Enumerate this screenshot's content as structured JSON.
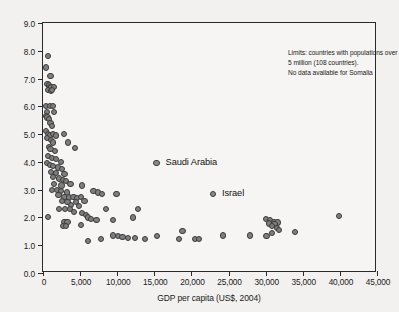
{
  "chart_data": {
    "type": "scatter",
    "title": "",
    "xlabel": "GDP per capita (US$, 2004)",
    "ylabel": "Total fertility rate (children per woman)",
    "xlim": [
      0,
      45000
    ],
    "ylim": [
      0.0,
      9.0
    ],
    "grid": false,
    "legend": "none",
    "xticks": [
      "0",
      "5,000",
      "10,000",
      "15,000",
      "20,000",
      "25,000",
      "30,000",
      "35,000",
      "40,000",
      "45,000"
    ],
    "xtick_values": [
      0,
      5000,
      10000,
      15000,
      20000,
      25000,
      30000,
      35000,
      40000,
      45000
    ],
    "yticks": [
      "0.0",
      "1.0",
      "2.0",
      "3.0",
      "4.0",
      "5.0",
      "6.0",
      "7.0",
      "8.0",
      "9.0"
    ],
    "ytick_values": [
      0,
      1,
      2,
      3,
      4,
      5,
      6,
      7,
      8,
      9
    ],
    "annotations": [
      {
        "name": "limits-note",
        "lines": [
          "Limits: countries with populations over",
          "5 million (108 countries).",
          "No data available for Somalia"
        ]
      }
    ],
    "point_labels": [
      {
        "name": "Saudi Arabia",
        "x": 15300,
        "y": 3.95
      },
      {
        "name": "Israel",
        "x": 22900,
        "y": 2.85
      }
    ],
    "marker": {
      "shape": "circle",
      "fill": "#7e7e7e",
      "edge": "#3b3b3b",
      "size_px": 6.2
    },
    "points": [
      [
        700,
        7.8
      ],
      [
        450,
        7.4
      ],
      [
        1000,
        7.1
      ],
      [
        600,
        6.8
      ],
      [
        800,
        6.75
      ],
      [
        950,
        6.7
      ],
      [
        1150,
        6.7
      ],
      [
        1500,
        6.7
      ],
      [
        700,
        6.6
      ],
      [
        1050,
        6.55
      ],
      [
        1250,
        6.6
      ],
      [
        400,
        6.0
      ],
      [
        900,
        6.0
      ],
      [
        1400,
        6.0
      ],
      [
        500,
        5.8
      ],
      [
        1500,
        5.8
      ],
      [
        350,
        5.65
      ],
      [
        600,
        5.6
      ],
      [
        800,
        5.55
      ],
      [
        1000,
        5.4
      ],
      [
        1200,
        5.3
      ],
      [
        450,
        5.1
      ],
      [
        700,
        5.0
      ],
      [
        900,
        4.95
      ],
      [
        1300,
        5.0
      ],
      [
        1700,
        4.95
      ],
      [
        2800,
        5.0
      ],
      [
        500,
        4.85
      ],
      [
        1100,
        4.8
      ],
      [
        1400,
        4.7
      ],
      [
        3400,
        4.7
      ],
      [
        800,
        4.55
      ],
      [
        1000,
        4.45
      ],
      [
        1600,
        4.4
      ],
      [
        4300,
        4.5
      ],
      [
        650,
        4.2
      ],
      [
        1200,
        4.15
      ],
      [
        1800,
        4.1
      ],
      [
        2400,
        4.0
      ],
      [
        500,
        3.95
      ],
      [
        900,
        3.9
      ],
      [
        1400,
        3.85
      ],
      [
        2000,
        3.8
      ],
      [
        2600,
        3.75
      ],
      [
        1100,
        3.65
      ],
      [
        1700,
        3.6
      ],
      [
        2900,
        3.55
      ],
      [
        1300,
        3.45
      ],
      [
        2200,
        3.4
      ],
      [
        2700,
        3.35
      ],
      [
        3100,
        3.3
      ],
      [
        1500,
        3.2
      ],
      [
        2500,
        3.15
      ],
      [
        3700,
        3.2
      ],
      [
        5200,
        3.15
      ],
      [
        1200,
        3.0
      ],
      [
        1900,
        3.0
      ],
      [
        2400,
        2.95
      ],
      [
        3200,
        2.9
      ],
      [
        6800,
        2.95
      ],
      [
        7400,
        2.9
      ],
      [
        2100,
        2.8
      ],
      [
        2900,
        2.75
      ],
      [
        3500,
        2.72
      ],
      [
        4100,
        2.75
      ],
      [
        4600,
        2.7
      ],
      [
        5100,
        2.75
      ],
      [
        7900,
        2.85
      ],
      [
        9900,
        2.85
      ],
      [
        2600,
        2.6
      ],
      [
        3300,
        2.55
      ],
      [
        4400,
        2.55
      ],
      [
        5600,
        2.6
      ],
      [
        3800,
        2.45
      ],
      [
        4900,
        2.4
      ],
      [
        2200,
        2.3
      ],
      [
        3000,
        2.3
      ],
      [
        3600,
        2.3
      ],
      [
        8500,
        2.3
      ],
      [
        12800,
        2.3
      ],
      [
        4200,
        2.2
      ],
      [
        5300,
        2.15
      ],
      [
        5800,
        2.1
      ],
      [
        700,
        2.02
      ],
      [
        6100,
        2.0
      ],
      [
        6500,
        1.95
      ],
      [
        7200,
        1.92
      ],
      [
        9400,
        1.92
      ],
      [
        12100,
        2.0
      ],
      [
        30000,
        1.95
      ],
      [
        39900,
        2.05
      ],
      [
        30600,
        1.9
      ],
      [
        31100,
        1.85
      ],
      [
        31600,
        1.82
      ],
      [
        30400,
        1.78
      ],
      [
        31200,
        1.75
      ],
      [
        30900,
        1.7
      ],
      [
        31500,
        1.62
      ],
      [
        2900,
        1.85
      ],
      [
        3300,
        1.85
      ],
      [
        2700,
        1.7
      ],
      [
        3100,
        1.68
      ],
      [
        5100,
        1.72
      ],
      [
        31800,
        1.55
      ],
      [
        33900,
        1.48
      ],
      [
        18800,
        1.52
      ],
      [
        30800,
        1.45
      ],
      [
        6100,
        1.15
      ],
      [
        7800,
        1.22
      ],
      [
        9400,
        1.35
      ],
      [
        10100,
        1.33
      ],
      [
        10700,
        1.3
      ],
      [
        11400,
        1.25
      ],
      [
        12400,
        1.25
      ],
      [
        13700,
        1.22
      ],
      [
        15400,
        1.33
      ],
      [
        18300,
        1.22
      ],
      [
        20500,
        1.22
      ],
      [
        21000,
        1.22
      ],
      [
        24200,
        1.35
      ],
      [
        27900,
        1.35
      ],
      [
        30100,
        1.33
      ]
    ]
  }
}
